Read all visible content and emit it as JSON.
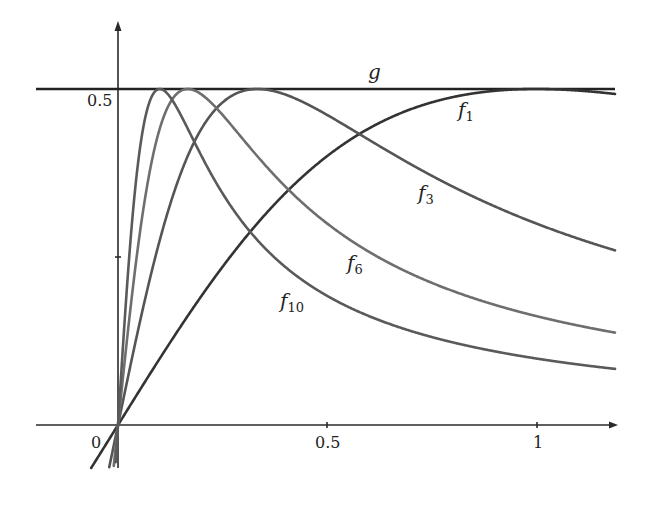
{
  "chart_data": {
    "type": "line",
    "title": "",
    "xlabel": "",
    "ylabel": "",
    "xlim": [
      -0.2,
      1.19
    ],
    "ylim": [
      -0.06,
      0.6
    ],
    "grid": false,
    "legend": "inline labels",
    "x_ticks": [
      {
        "value": 0,
        "label": "0"
      },
      {
        "value": 0.5,
        "label": "0.5"
      },
      {
        "value": 1,
        "label": "1"
      }
    ],
    "y_ticks": [
      {
        "value": 0.5,
        "label": "0.5"
      }
    ],
    "series": [
      {
        "name": "g",
        "formula": "g(x) = 1/2",
        "n": 0,
        "color": "#222222",
        "label_pos": [
          0.61,
          0.54
        ]
      },
      {
        "name": "f1",
        "formula": "f_1(x) = x/(1+x^2)",
        "n": 1,
        "color": "#333333",
        "label_pos": [
          0.82,
          0.46
        ]
      },
      {
        "name": "f3",
        "formula": "f_3(x) = 3x/(1+9x^2)",
        "n": 3,
        "color": "#555555",
        "label_pos": [
          0.71,
          0.33
        ]
      },
      {
        "name": "f6",
        "formula": "f_6(x) = 6x/(1+36x^2)",
        "n": 6,
        "color": "#6e6e6e",
        "label_pos": [
          0.55,
          0.22
        ]
      },
      {
        "name": "f10",
        "formula": "f_10(x) = 10x/(1+100x^2)",
        "n": 10,
        "color": "#5a5a5a",
        "label_pos": [
          0.38,
          0.16
        ]
      }
    ],
    "annotations": [
      "g",
      "f1",
      "f3",
      "f6",
      "f10"
    ],
    "peaks": [
      {
        "series": "f1",
        "x": 1.0,
        "y": 0.5
      },
      {
        "series": "f3",
        "x": 0.333,
        "y": 0.5
      },
      {
        "series": "f6",
        "x": 0.167,
        "y": 0.5
      },
      {
        "series": "f10",
        "x": 0.1,
        "y": 0.5
      }
    ]
  },
  "labels": {
    "g": "g",
    "f1_base": "f",
    "f1_sub": "1",
    "f3_base": "f",
    "f3_sub": "3",
    "f6_base": "f",
    "f6_sub": "6",
    "f10_base": "f",
    "f10_sub": "10",
    "x0": "0",
    "x05": "0.5",
    "x1": "1",
    "y05": "0.5"
  }
}
